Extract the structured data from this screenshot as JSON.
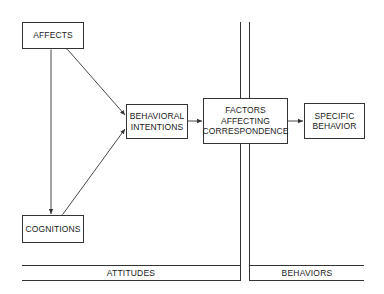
{
  "diagram": {
    "nodes": {
      "affects": {
        "label": "AFFECTS"
      },
      "cognitions": {
        "label": "COGNITIONS"
      },
      "intentions": {
        "line1": "BEHAVIORAL",
        "line2": "INTENTIONS"
      },
      "factors": {
        "line1": "FACTORS",
        "line2": "AFFECTING",
        "line3": "CORRESPONDENCE"
      },
      "behavior": {
        "line1": "SPECIFIC",
        "line2": "BEHAVIOR"
      }
    },
    "regions": {
      "left": "ATTITUDES",
      "right": "BEHAVIORS"
    },
    "edges": [
      {
        "from": "affects",
        "to": "cognitions",
        "type": "bidirectional"
      },
      {
        "from": "affects",
        "to": "intentions",
        "type": "bidirectional"
      },
      {
        "from": "cognitions",
        "to": "intentions",
        "type": "bidirectional"
      },
      {
        "from": "intentions",
        "to": "factors",
        "type": "directed"
      },
      {
        "from": "factors",
        "to": "behavior",
        "type": "directed"
      }
    ],
    "colors": {
      "line": "#333333",
      "background": "#ffffff"
    }
  }
}
